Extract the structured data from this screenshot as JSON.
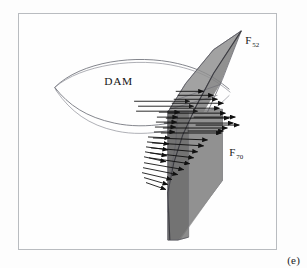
{
  "figure": {
    "caption": "(e)",
    "panel_letter": "e",
    "frame": {
      "border_color": "#b9bcc0",
      "background": "#fefefe"
    },
    "labels": {
      "dam": "DAM",
      "force_upper_symbol": "F",
      "force_upper_subscript": "52",
      "force_lower_symbol": "F",
      "force_lower_subscript": "70"
    },
    "colors": {
      "surface_fill_light": "#9a9a9a",
      "surface_fill_mid": "#8d8d8d",
      "surface_fill_dark": "#7d7d7d",
      "surface_fill_darkest": "#6f6f6f",
      "outline": "#5a5a62",
      "dam_outline": "#6e7078",
      "arrow": "#111111",
      "text": "#161616"
    },
    "elements": {
      "dam_outline_name": "dam-reservoir-outline",
      "upper_fin_name": "upper-fin-surface",
      "lower_panel_name": "lower-panel-surface",
      "arrow_field_name": "force-vector-field",
      "arrow_count": 34
    }
  }
}
